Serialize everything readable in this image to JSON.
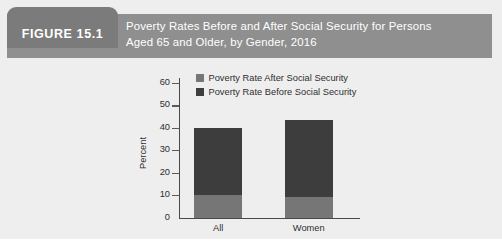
{
  "figure": {
    "tab_label": "FIGURE 15.1",
    "title_line_1": "Poverty Rates Before and After Social Security for Persons",
    "title_line_2": "Aged 65 and Older, by Gender, 2016",
    "tab_color": "#7b7b7b",
    "header_color": "#8f8f8f",
    "panel_color": "#eeeeee",
    "title_text_color": "#ffffff"
  },
  "chart_data": {
    "type": "bar",
    "subtype": "stacked-vertical",
    "title": "Poverty Rates Before and After Social Security for Persons Aged 65 and Older, by Gender, 2016",
    "xlabel": "",
    "ylabel": "Percent",
    "categories": [
      "All",
      "Women"
    ],
    "ylim": [
      0,
      60
    ],
    "yticks": [
      0,
      10,
      20,
      30,
      40,
      50,
      60
    ],
    "ytick_labels": [
      "0",
      "10",
      "20",
      "30",
      "40",
      "50",
      "60"
    ],
    "grid": false,
    "legend_position": "top-center",
    "series": [
      {
        "name": "Poverty Rate After Social Security",
        "color": "#767676",
        "values": [
          10,
          9
        ]
      },
      {
        "name": "Poverty Rate Before Social Security",
        "color": "#3d3d3d",
        "values": [
          40,
          43.5
        ]
      }
    ],
    "stack_note": "Dark segment top equals the Before-Social-Security total rate; light segment height equals the After-Social-Security rate.",
    "totals": [
      40,
      43.5
    ]
  }
}
